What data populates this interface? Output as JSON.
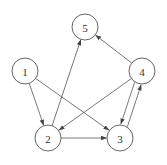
{
  "graph": {
    "type": "directed",
    "nodes": [
      {
        "id": "1",
        "label": "1",
        "x": 25,
        "y": 71
      },
      {
        "id": "2",
        "label": "2",
        "x": 48,
        "y": 138
      },
      {
        "id": "3",
        "label": "3",
        "x": 120,
        "y": 138
      },
      {
        "id": "4",
        "label": "4",
        "x": 142,
        "y": 71
      },
      {
        "id": "5",
        "label": "5",
        "x": 85,
        "y": 27
      }
    ],
    "edges": [
      {
        "from": "1",
        "to": "2"
      },
      {
        "from": "1",
        "to": "3"
      },
      {
        "from": "2",
        "to": "5"
      },
      {
        "from": "2",
        "to": "3"
      },
      {
        "from": "4",
        "to": "5"
      },
      {
        "from": "4",
        "to": "2"
      },
      {
        "from": "4",
        "to": "3"
      },
      {
        "from": "3",
        "to": "4"
      }
    ],
    "node_radius": 13
  }
}
